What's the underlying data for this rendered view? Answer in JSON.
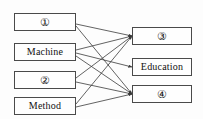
{
  "diagram": {
    "type": "bipartite-mapping-diagram",
    "background_color": "#fdfdfd",
    "box_border_color": "#4a4a4a",
    "edge_color": "#3b3b3b",
    "text_color": "#111111",
    "left_nodes": [
      {
        "id": "L1",
        "label": "①",
        "circled": true,
        "x": 14,
        "y": 13,
        "w": 62,
        "h": 18
      },
      {
        "id": "L2",
        "label": "Machine",
        "circled": false,
        "x": 14,
        "y": 43,
        "w": 62,
        "h": 18
      },
      {
        "id": "L3",
        "label": "②",
        "circled": true,
        "x": 14,
        "y": 71,
        "w": 62,
        "h": 18
      },
      {
        "id": "L4",
        "label": "Method",
        "circled": false,
        "x": 14,
        "y": 97,
        "w": 62,
        "h": 18
      }
    ],
    "right_nodes": [
      {
        "id": "R1",
        "label": "③",
        "circled": true,
        "x": 132,
        "y": 27,
        "w": 60,
        "h": 18
      },
      {
        "id": "R2",
        "label": "Education",
        "circled": false,
        "x": 132,
        "y": 58,
        "w": 60,
        "h": 18
      },
      {
        "id": "R3",
        "label": "④",
        "circled": true,
        "x": 132,
        "y": 85,
        "w": 60,
        "h": 18
      }
    ],
    "edges": [
      {
        "from": "L1",
        "to": "R1",
        "x1": 76,
        "y1": 24,
        "x2": 132,
        "y2": 36
      },
      {
        "from": "L1",
        "to": "R3",
        "x1": 76,
        "y1": 26,
        "x2": 132,
        "y2": 94
      },
      {
        "from": "L2",
        "to": "R1",
        "x1": 76,
        "y1": 50,
        "x2": 132,
        "y2": 36
      },
      {
        "from": "L2",
        "to": "R2",
        "x1": 76,
        "y1": 53,
        "x2": 132,
        "y2": 67
      },
      {
        "from": "L2",
        "to": "R3",
        "x1": 76,
        "y1": 56,
        "x2": 132,
        "y2": 94
      },
      {
        "from": "L3",
        "to": "R1",
        "x1": 76,
        "y1": 78,
        "x2": 132,
        "y2": 36
      },
      {
        "from": "L3",
        "to": "R3",
        "x1": 76,
        "y1": 82,
        "x2": 132,
        "y2": 94
      },
      {
        "from": "L4",
        "to": "R1",
        "x1": 76,
        "y1": 104,
        "x2": 132,
        "y2": 36
      },
      {
        "from": "L4",
        "to": "R3",
        "x1": 76,
        "y1": 107,
        "x2": 132,
        "y2": 94
      }
    ]
  }
}
